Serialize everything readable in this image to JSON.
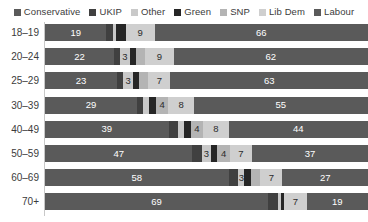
{
  "chart_data": {
    "type": "bar",
    "subtype": "stacked-horizontal-percentage",
    "title": "",
    "xlabel": "",
    "ylabel": "",
    "xlim": [
      0,
      100
    ],
    "grid": false,
    "legend_position": "top-center",
    "categories": [
      "18–19",
      "20–24",
      "25–29",
      "30–39",
      "40–49",
      "50–59",
      "60–69",
      "70+"
    ],
    "series": [
      {
        "name": "Conservative",
        "color": "#5a5a5a",
        "values": [
          19,
          22,
          23,
          29,
          39,
          47,
          58,
          69
        ]
      },
      {
        "name": "UKIP",
        "color": "#404040",
        "values": [
          2,
          2,
          2,
          2,
          3,
          3,
          3,
          3
        ]
      },
      {
        "name": "Other",
        "color": "#c9c9c9",
        "values": [
          1,
          3,
          3,
          2,
          2,
          3,
          2,
          1
        ]
      },
      {
        "name": "Green",
        "color": "#262626",
        "values": [
          3,
          2,
          2,
          2,
          2,
          2,
          2,
          1
        ]
      },
      {
        "name": "SNP",
        "color": "#b4b4b4",
        "values": [
          0,
          3,
          3,
          4,
          4,
          4,
          3,
          0
        ]
      },
      {
        "name": "Lib Dem",
        "color": "#cfcfcf",
        "values": [
          9,
          9,
          7,
          8,
          8,
          7,
          7,
          7
        ]
      },
      {
        "name": "Labour",
        "color": "#5a5a5a",
        "values": [
          66,
          62,
          63,
          55,
          44,
          37,
          27,
          19
        ]
      }
    ],
    "visible_labels": {
      "18–19": {
        "Conservative": "19",
        "Lib Dem": "9",
        "Labour": "66"
      },
      "20–24": {
        "Conservative": "22",
        "Other": "3",
        "Lib Dem": "9",
        "Labour": "62"
      },
      "25–29": {
        "Conservative": "23",
        "Other": "3",
        "Lib Dem": "7",
        "Labour": "63"
      },
      "30–39": {
        "Conservative": "29",
        "SNP": "4",
        "Lib Dem": "8",
        "Labour": "55"
      },
      "40–49": {
        "Conservative": "39",
        "SNP": "4",
        "Lib Dem": "8",
        "Labour": "44"
      },
      "50–59": {
        "Conservative": "47",
        "Other": "3",
        "SNP": "4",
        "Lib Dem": "7",
        "Labour": "37"
      },
      "60–69": {
        "Conservative": "58",
        "Other": "3",
        "Lib Dem": "7",
        "Labour": "27"
      },
      "70+": {
        "Conservative": "69",
        "Lib Dem": "7",
        "Labour": "19"
      }
    }
  },
  "legend": {
    "items": [
      {
        "label": "Conservative",
        "color": "#5a5a5a"
      },
      {
        "label": "UKIP",
        "color": "#404040"
      },
      {
        "label": "Other",
        "color": "#c9c9c9"
      },
      {
        "label": "Green",
        "color": "#262626"
      },
      {
        "label": "SNP",
        "color": "#b4b4b4"
      },
      {
        "label": "Lib Dem",
        "color": "#cfcfcf"
      },
      {
        "label": "Labour",
        "color": "#5a5a5a"
      }
    ]
  },
  "axis": {
    "category_labels": [
      "18–19",
      "20–24",
      "25–29",
      "30–39",
      "40–49",
      "50–59",
      "60–69",
      "70+"
    ]
  },
  "colors": {
    "background": "#ffffff",
    "text": "#3b3b3b",
    "axis_line": "#c8c8c8",
    "label_light": "#ffffff",
    "label_dark": "#2b2b2b"
  }
}
